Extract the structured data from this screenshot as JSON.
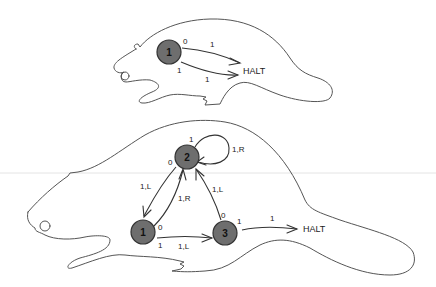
{
  "diagram": {
    "type": "busy-beaver-turing-machine-state-diagrams",
    "colors": {
      "state_fill": "#6e6e6e",
      "outline": "#555555",
      "background": "#ffffff"
    },
    "top_machine": {
      "states": [
        {
          "id": "1",
          "label": "1"
        }
      ],
      "halt_label": "HALT",
      "edges": [
        {
          "from": "1",
          "to": "HALT",
          "read": "0",
          "write": "1"
        },
        {
          "from": "1",
          "to": "HALT",
          "read": "1",
          "write": "1"
        }
      ],
      "labels": {
        "read0": "0",
        "write_top": "1",
        "read1": "1",
        "write_bottom": "1"
      }
    },
    "bottom_machine": {
      "states": [
        {
          "id": "1",
          "label": "1"
        },
        {
          "id": "2",
          "label": "2"
        },
        {
          "id": "3",
          "label": "3"
        }
      ],
      "halt_label": "HALT",
      "edges": [
        {
          "from": "2",
          "to": "2",
          "read": "1",
          "action": "1,R"
        },
        {
          "from": "2",
          "to": "1",
          "read": "0",
          "action": "1,L"
        },
        {
          "from": "1",
          "to": "2",
          "read": "0",
          "action": "1,R"
        },
        {
          "from": "1",
          "to": "3",
          "read": "1",
          "action": "1,L"
        },
        {
          "from": "3",
          "to": "2",
          "read": "0",
          "action": "1,L"
        },
        {
          "from": "3",
          "to": "HALT",
          "read": "1",
          "action": "1"
        }
      ],
      "labels": {
        "s2_read1": "1",
        "s2_loop": "1,R",
        "s2_read0": "0",
        "s2_to_s1": "1,L",
        "s1_read0": "0",
        "s1_to_s2": "1,R",
        "s1_read1": "1",
        "s1_to_s3": "1,L",
        "s3_read0": "0",
        "s3_to_s2": "1,L",
        "s3_read1": "1",
        "s3_to_halt": "1"
      }
    }
  }
}
